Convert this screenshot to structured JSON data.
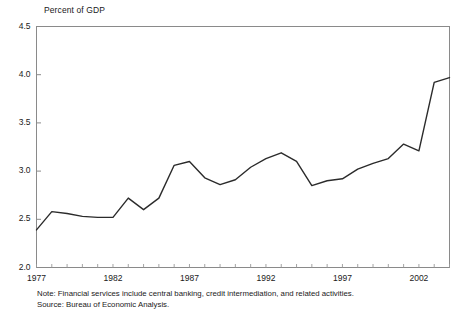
{
  "chart_data": {
    "type": "line",
    "title": "Percent of GDP",
    "xlabel": "",
    "ylabel": "Percent of GDP",
    "ylim": [
      2.0,
      4.5
    ],
    "xlim": [
      1977,
      2003
    ],
    "ytick_labels": [
      "2.0",
      "2.5",
      "3.0",
      "3.5",
      "4.0",
      "4.5"
    ],
    "ytick_values": [
      2.0,
      2.5,
      3.0,
      3.5,
      4.0,
      4.5
    ],
    "xtick_labels": [
      "1977",
      "1982",
      "1987",
      "1992",
      "1997",
      "2002"
    ],
    "xtick_values": [
      1977,
      1982,
      1987,
      1992,
      1997,
      2002
    ],
    "minor_xticks_every": 1,
    "grid": false,
    "legend": null,
    "line_color": "#2b2b2b",
    "line_width": 1.4,
    "x": [
      1977,
      1978,
      1979,
      1980,
      1981,
      1982,
      1983,
      1984,
      1985,
      1986,
      1987,
      1988,
      1989,
      1990,
      1991,
      1992,
      1993,
      1994,
      1995,
      1996,
      1997,
      1998,
      1999,
      2000,
      2001,
      2002,
      2003
    ],
    "values": [
      2.39,
      2.58,
      2.56,
      2.53,
      2.52,
      2.52,
      2.72,
      2.6,
      2.72,
      3.06,
      3.1,
      2.93,
      2.86,
      2.91,
      3.04,
      3.13,
      3.19,
      3.1,
      2.85,
      2.9,
      2.92,
      3.02,
      3.08,
      3.13,
      3.28,
      3.21,
      3.92
    ],
    "series": [
      {
        "name": "Financial services value added",
        "values": [
          2.39,
          2.58,
          2.56,
          2.53,
          2.52,
          2.52,
          2.72,
          2.6,
          2.72,
          3.06,
          3.1,
          2.93,
          2.86,
          2.91,
          3.04,
          3.13,
          3.19,
          3.1,
          2.85,
          2.9,
          2.92,
          3.02,
          3.08,
          3.13,
          3.28,
          3.21,
          3.92
        ]
      }
    ],
    "last_point": {
      "x": 2004,
      "y": 3.97
    },
    "notes": [
      "Note: Financial services include central banking, credit intermediation, and related activities.",
      "Source: Bureau of Economic Analysis."
    ]
  }
}
